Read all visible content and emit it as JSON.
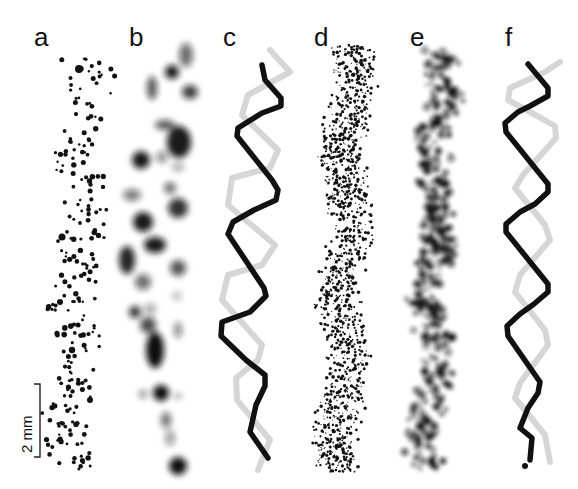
{
  "figure": {
    "panels": [
      {
        "id": "a",
        "label": "a",
        "style": "sparse black dots"
      },
      {
        "id": "b",
        "label": "b",
        "style": "blurred grey blobs"
      },
      {
        "id": "c",
        "label": "c",
        "style": "double helix (black and light grey strands)"
      },
      {
        "id": "d",
        "label": "d",
        "style": "dense black speckle"
      },
      {
        "id": "e",
        "label": "e",
        "style": "blurred dense speckle"
      },
      {
        "id": "f",
        "label": "f",
        "style": "double helix (black and light grey strands)"
      }
    ],
    "scale_bar": {
      "label": "2 mm"
    },
    "colors": {
      "strand_dark": "#111111",
      "strand_light": "#d9d9d9",
      "ink": "#111111",
      "background": "#ffffff"
    }
  }
}
